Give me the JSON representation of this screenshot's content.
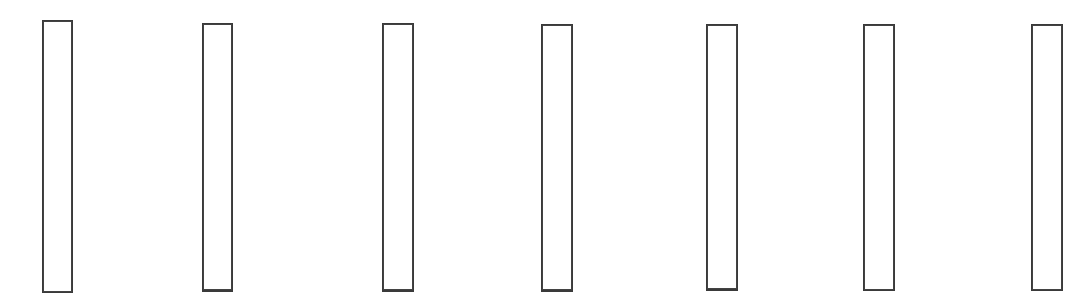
{
  "page": {
    "background_color": "#ffffff",
    "width": 1092,
    "height": 299,
    "visible_text": ""
  },
  "style": {
    "stroke_color": "#3a3a3a",
    "fill_color": "#ffffff",
    "stroke_width_px": 2
  },
  "boxes": [
    {
      "label": "",
      "index": 1,
      "x": 42,
      "y": 20,
      "width": 31,
      "height": 273,
      "border_top": 2,
      "border_right": 2,
      "border_bottom": 2,
      "border_left": 2
    },
    {
      "label": "",
      "index": 2,
      "x": 202,
      "y": 23,
      "width": 31,
      "height": 269,
      "border_top": 2,
      "border_right": 2,
      "border_bottom": 3,
      "border_left": 2
    },
    {
      "label": "",
      "index": 3,
      "x": 382,
      "y": 23,
      "width": 32,
      "height": 269,
      "border_top": 2,
      "border_right": 2,
      "border_bottom": 3,
      "border_left": 2
    },
    {
      "label": "",
      "index": 4,
      "x": 541,
      "y": 24,
      "width": 32,
      "height": 268,
      "border_top": 2,
      "border_right": 2,
      "border_bottom": 3,
      "border_left": 2
    },
    {
      "label": "",
      "index": 5,
      "x": 706,
      "y": 24,
      "width": 32,
      "height": 267,
      "border_top": 2,
      "border_right": 2,
      "border_bottom": 3,
      "border_left": 2
    },
    {
      "label": "",
      "index": 6,
      "x": 863,
      "y": 24,
      "width": 32,
      "height": 267,
      "border_top": 2,
      "border_right": 2,
      "border_bottom": 2,
      "border_left": 2
    },
    {
      "label": "",
      "index": 7,
      "x": 1031,
      "y": 24,
      "width": 32,
      "height": 267,
      "border_top": 2,
      "border_right": 2,
      "border_bottom": 2,
      "border_left": 2
    }
  ]
}
